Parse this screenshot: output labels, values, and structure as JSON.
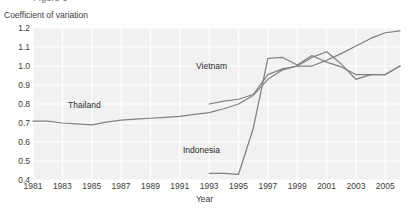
{
  "figure": {
    "cutoff_text_top": "Figure 3",
    "plot_bg_color": "#f1f1f1",
    "grid_color": "#ffffff",
    "line_color": "#808080",
    "axis_text_color": "#3b3b3b"
  },
  "axes": {
    "y_axis_title": "Coefficient of variation",
    "x_axis_title": "Year",
    "y_ticks": [
      "1.2",
      "1.1",
      "1.0",
      "0.9",
      "0.8",
      "0.7",
      "0.6",
      "0.5",
      "0.4"
    ],
    "x_ticks": [
      "1981",
      "1983",
      "1985",
      "1987",
      "1989",
      "1991",
      "1993",
      "1995",
      "1997",
      "1999",
      "2001",
      "2003",
      "2005"
    ]
  },
  "series_labels": [
    {
      "name": "Vietnam",
      "text": "Vietnam"
    },
    {
      "name": "Thailand",
      "text": "Thailand"
    },
    {
      "name": "Indonesia",
      "text": "Indonesia"
    }
  ],
  "chart_data": {
    "type": "line",
    "title": "",
    "xlabel": "Year",
    "ylabel": "Coefficient of variation",
    "xlim": [
      1981,
      2006
    ],
    "ylim": [
      0.4,
      1.2
    ],
    "grid": true,
    "legend": "inline-annotations",
    "x": [
      1981,
      1982,
      1983,
      1984,
      1985,
      1986,
      1987,
      1988,
      1989,
      1990,
      1991,
      1992,
      1993,
      1994,
      1995,
      1996,
      1997,
      1998,
      1999,
      2000,
      2001,
      2002,
      2003,
      2004,
      2005,
      2006
    ],
    "series": [
      {
        "name": "Thailand",
        "label_text": "Thailand",
        "color": "#808080",
        "x": [
          1981,
          1982,
          1983,
          1984,
          1985,
          1986,
          1987,
          1988,
          1989,
          1990,
          1991,
          1992,
          1993,
          1994,
          1995,
          1996,
          1997,
          1998,
          1999,
          2000,
          2001,
          2002,
          2003,
          2004,
          2005,
          2006
        ],
        "values": [
          0.71,
          0.71,
          0.7,
          0.695,
          0.69,
          0.705,
          0.715,
          0.72,
          0.725,
          0.73,
          0.735,
          0.745,
          0.755,
          0.775,
          0.8,
          0.845,
          0.93,
          0.98,
          1.0,
          1.045,
          1.075,
          1.01,
          0.93,
          0.955,
          0.955,
          1.0
        ]
      },
      {
        "name": "Vietnam",
        "label_text": "Vietnam",
        "color": "#808080",
        "x": [
          1993,
          1994,
          1995,
          1996,
          1997,
          1998,
          1999,
          2000,
          2001,
          2002,
          2003,
          2004,
          2005,
          2006
        ],
        "values": [
          0.8,
          0.815,
          0.825,
          0.85,
          0.955,
          0.985,
          1.0,
          1.0,
          1.03,
          1.065,
          1.105,
          1.145,
          1.175,
          1.185
        ]
      },
      {
        "name": "Indonesia",
        "label_text": "Indonesia",
        "color": "#808080",
        "x": [
          1993,
          1994,
          1995,
          1996,
          1997,
          1998,
          1999,
          2000,
          2001,
          2002,
          2003,
          2004,
          2005,
          2006
        ],
        "values": [
          0.435,
          0.435,
          0.43,
          0.67,
          1.04,
          1.045,
          1.005,
          1.055,
          1.02,
          0.995,
          0.955,
          0.955,
          0.955,
          1.0
        ]
      }
    ]
  }
}
